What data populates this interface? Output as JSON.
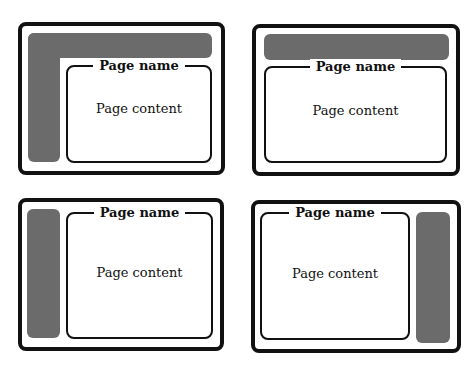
{
  "layouts": [
    {
      "id": "top-and-left-navigation",
      "title": "Page name",
      "content": "Page content"
    },
    {
      "id": "top-navigation",
      "title": "Page name",
      "content": "Page content"
    },
    {
      "id": "left-navigation",
      "title": "Page name",
      "content": "Page content"
    },
    {
      "id": "right-navigation",
      "title": "Page name",
      "content": "Page content"
    }
  ],
  "colors": {
    "frame": "#111111",
    "navigation": "#6b6b6b",
    "background": "#ffffff"
  }
}
